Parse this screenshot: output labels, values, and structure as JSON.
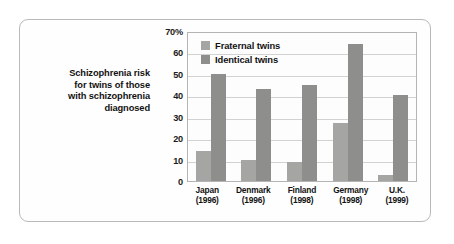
{
  "caption": {
    "lines": [
      "Schizophrenia risk",
      "for twins of those",
      "with schizophrenia",
      "diagnosed"
    ]
  },
  "chart_data": {
    "type": "bar",
    "title": "",
    "subtitle": "",
    "xlabel": "",
    "ylabel": "",
    "categories": [
      "Japan\n(1996)",
      "Denmark\n(1996)",
      "Finland\n(1998)",
      "Germany\n(1998)",
      "U.K.\n(1999)"
    ],
    "category_names": [
      "Japan",
      "Denmark",
      "Finland",
      "Germany",
      "U.K."
    ],
    "category_years": [
      "(1996)",
      "(1996)",
      "(1998)",
      "(1998)",
      "(1999)"
    ],
    "series": [
      {
        "name": "Fraternal twins",
        "color": "#a5a5a3",
        "values": [
          14,
          10,
          9,
          27,
          3
        ]
      },
      {
        "name": "Identical twins",
        "color": "#8e8e8c",
        "values": [
          50,
          43,
          45,
          64,
          40
        ]
      }
    ],
    "ylim": [
      0,
      70
    ],
    "ytick_values": [
      0,
      10,
      20,
      30,
      40,
      50,
      60,
      70
    ],
    "ytick_labels": [
      "0",
      "10",
      "20",
      "30",
      "40",
      "50",
      "60",
      "70%"
    ],
    "grid": true,
    "legend_position": "top-left-inside",
    "unit": "%"
  },
  "colors": {
    "fraternal": "#a5a5a3",
    "identical": "#8e8e8c",
    "frame": "#b9b9b7",
    "gridline": "#d2d2d0",
    "text": "#121212"
  }
}
